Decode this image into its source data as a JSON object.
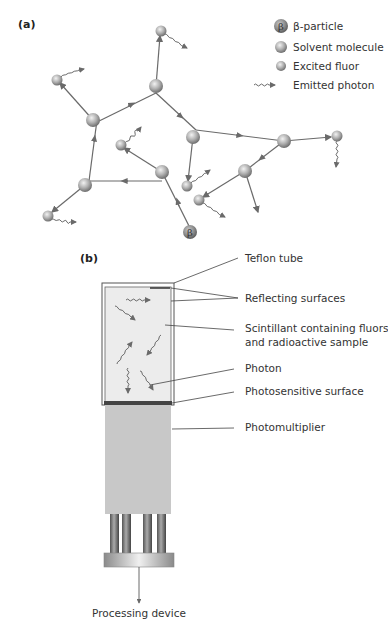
{
  "panel_a": {
    "label": "(a)",
    "legend": [
      {
        "icon": "beta-particle-icon",
        "symbol": "β",
        "label": "β-particle"
      },
      {
        "icon": "solvent-molecule-icon",
        "label": "Solvent molecule"
      },
      {
        "icon": "excited-fluor-icon",
        "label": "Excited fluor"
      },
      {
        "icon": "emitted-photon-icon",
        "label": "Emitted photon"
      }
    ],
    "beta_symbol": "β"
  },
  "panel_b": {
    "label": "(b)",
    "labels": {
      "teflon_tube": "Teflon tube",
      "reflecting_surfaces": "Reflecting surfaces",
      "scintillant_line1": "Scintillant containing fluors",
      "scintillant_line2": "and radioactive sample",
      "photon": "Photon",
      "photosensitive_surface": "Photosensitive surface",
      "photomultiplier": "Photomultiplier",
      "processing_device": "Processing device"
    }
  },
  "colors": {
    "line": "#6a6a6a",
    "ball_light": "#e6e6e6",
    "ball_dark": "#7d7d7d",
    "scintillant": "#ececec",
    "photomultiplier": "#c8c8c8",
    "photosensitive": "#444444"
  }
}
